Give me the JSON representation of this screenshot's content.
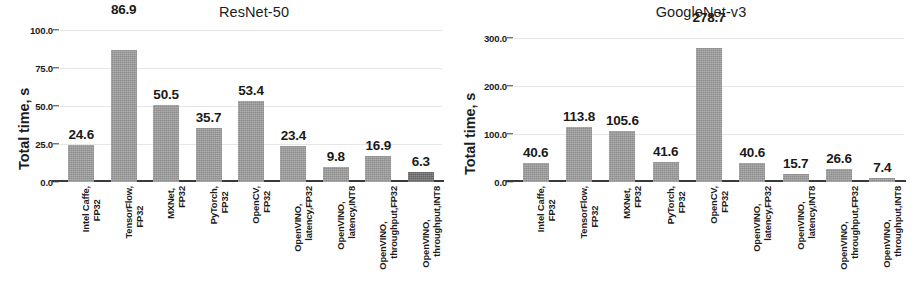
{
  "figure": {
    "background": "#ffffff",
    "bar_color": "#9c9c9c",
    "bar_color_highlight": "#6f6f6f",
    "axis_color": "#3a3a3a",
    "grid_color": "#e6e6e6"
  },
  "chart_data": [
    {
      "type": "bar",
      "title": "ResNet-50",
      "xlabel": "",
      "ylabel": "Total time, s",
      "ylim": [
        0,
        100
      ],
      "yticks": [
        "0.0",
        "25.0",
        "50.0",
        "75.0",
        "100.0"
      ],
      "ytick_values": [
        0,
        25,
        50,
        75,
        100
      ],
      "grid": true,
      "legend": "none",
      "categories": [
        "Intel Caffe, FP32",
        "TensorFlow, FP32",
        "MXNet, FP32",
        "PyTorch, FP32",
        "OpenCV, FP32",
        "OpenVINO, latency,FP32",
        "OpenVINO, latency,INT8",
        "OpenVINO, throughput,FP32",
        "OpenVINO, throughput,INT8"
      ],
      "category_lines": [
        [
          "Intel Caffe,",
          "FP32"
        ],
        [
          "TensorFlow,",
          "FP32"
        ],
        [
          "MXNet,",
          "FP32"
        ],
        [
          "PyTorch,",
          "FP32"
        ],
        [
          "OpenCV,",
          "FP32"
        ],
        [
          "OpenVINO,",
          "latency,FP32"
        ],
        [
          "OpenVINO,",
          "latency,INT8"
        ],
        [
          "OpenVINO,",
          "throughput,FP32"
        ],
        [
          "OpenVINO,",
          "throughput,INT8"
        ]
      ],
      "values": [
        24.6,
        86.9,
        50.5,
        35.7,
        53.4,
        23.4,
        9.8,
        16.9,
        6.3
      ],
      "value_labels": [
        "24.6",
        "86.9",
        "50.5",
        "35.7",
        "53.4",
        "23.4",
        "9.8",
        "16.9",
        "6.3"
      ],
      "highlight_index": 8
    },
    {
      "type": "bar",
      "title": "GoogleNet-v3",
      "xlabel": "",
      "ylabel": "Total time, s",
      "ylim": [
        0,
        300
      ],
      "yticks": [
        "0.0",
        "100.0",
        "200.0",
        "300.0"
      ],
      "ytick_values": [
        0,
        100,
        200,
        300
      ],
      "grid": true,
      "legend": "none",
      "categories": [
        "Intel Caffe, FP32",
        "TensorFlow, FP32",
        "MXNet, FP32",
        "PyTorch, FP32",
        "OpenCV, FP32",
        "OpenVINO, latency,FP32",
        "OpenVINO, latency,INT8",
        "OpenVINO, throughput,FP32",
        "OpenVINO, throughput,INT8"
      ],
      "category_lines": [
        [
          "Intel Caffe,",
          "FP32"
        ],
        [
          "TensorFlow,",
          "FP32"
        ],
        [
          "MXNet,",
          "FP32"
        ],
        [
          "PyTorch,",
          "FP32"
        ],
        [
          "OpenCV,",
          "FP32"
        ],
        [
          "OpenVINO,",
          "latency,FP32"
        ],
        [
          "OpenVINO,",
          "latency,INT8"
        ],
        [
          "OpenVINO,",
          "throughput,FP32"
        ],
        [
          "OpenVINO,",
          "throughput,INT8"
        ]
      ],
      "values": [
        40.6,
        113.8,
        105.6,
        41.6,
        278.7,
        40.6,
        15.7,
        26.6,
        7.4
      ],
      "value_labels": [
        "40.6",
        "113.8",
        "105.6",
        "41.6",
        "278.7",
        "40.6",
        "15.7",
        "26.6",
        "7.4"
      ],
      "highlight_index": -1
    }
  ]
}
